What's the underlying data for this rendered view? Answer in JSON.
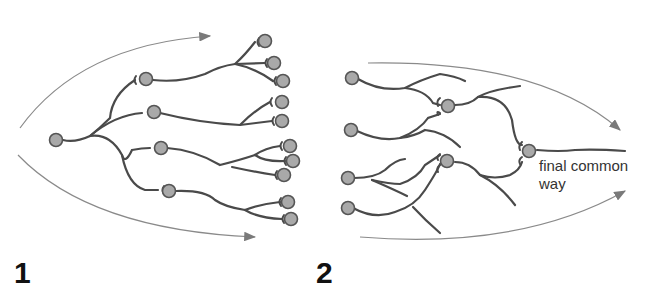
{
  "diagram": {
    "panels": [
      {
        "id": "1",
        "label": "1",
        "description": "Divergence: one neuron branches to many target neurons",
        "source_nodes": 1,
        "intermediate_nodes": 4,
        "terminal_nodes": 12,
        "flow_direction": "left-to-right, diverging"
      },
      {
        "id": "2",
        "label": "2",
        "description": "Convergence: many neurons converge to a single output",
        "source_nodes": 4,
        "intermediate_nodes": 2,
        "terminal_nodes": 1,
        "flow_direction": "left-to-right, converging",
        "annotation": "final common way"
      }
    ],
    "annotation_line1": "final common",
    "annotation_line2": "way",
    "colors": {
      "node_fill": "#a9a9a9",
      "node_stroke": "#555555",
      "branch": "#4a4a4a",
      "arrow": "#8a8a8a",
      "label": "#111111"
    }
  }
}
